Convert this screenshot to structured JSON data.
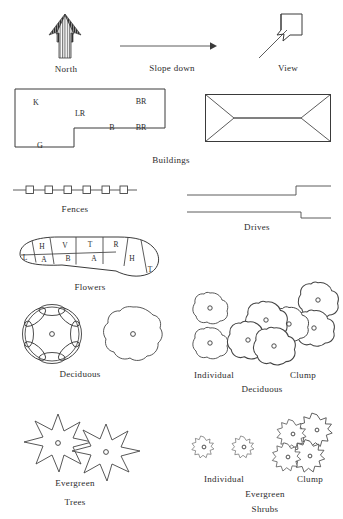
{
  "legend": {
    "title": "Site Plan Symbols",
    "north": {
      "label": "North",
      "icon": "north-arrow-icon"
    },
    "slope": {
      "label": "Slope down",
      "icon": "slope-arrow-icon"
    },
    "view": {
      "label": "View",
      "icon": "view-arrow-icon"
    },
    "buildings": {
      "caption": "Buildings",
      "floor_plan_labels": [
        {
          "text": "K",
          "x": 36,
          "y": 102
        },
        {
          "text": "LR",
          "x": 80,
          "y": 113
        },
        {
          "text": "BR",
          "x": 141,
          "y": 101
        },
        {
          "text": "B",
          "x": 112,
          "y": 127
        },
        {
          "text": "BR",
          "x": 141,
          "y": 127
        },
        {
          "text": "G",
          "x": 40,
          "y": 145
        }
      ],
      "roof_plan_name": "hip-roof-plan"
    },
    "fences": {
      "caption": "Fences",
      "post_count": 6
    },
    "drives": {
      "caption": "Drives"
    },
    "flowers": {
      "caption": "Flowers",
      "bed_cells_top": [
        "L",
        "H",
        "V",
        "T",
        "R"
      ],
      "bed_cells_bottom": [
        "A",
        "B",
        "A",
        "H",
        "T"
      ]
    },
    "deciduous_trees": {
      "caption": "Deciduous",
      "symbol_count": 2
    },
    "deciduous_shrubs": {
      "caption": "Deciduous",
      "individual_label": "Individual",
      "clump_label": "Clump",
      "individual_count": 2,
      "clump_count": 6
    },
    "evergreen_trees": {
      "caption_line1": "Evergreen",
      "caption_line2": "Trees",
      "symbol_count": 2,
      "points_per_star": 9
    },
    "evergreen_shrubs": {
      "caption_line1": "Evergreen",
      "caption_line2": "Shrubs",
      "individual_label": "Individual",
      "clump_label": "Clump",
      "individual_count": 2,
      "clump_count": 4
    },
    "colors": {
      "ink": "#3a3a3a",
      "text": "#2b2b2b",
      "paper": "#ffffff"
    }
  }
}
